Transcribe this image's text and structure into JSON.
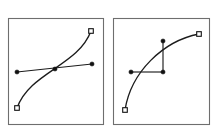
{
  "figure": {
    "width": 220,
    "height": 132,
    "background_color": "#ffffff",
    "stroke_color": "#1c1c1c",
    "frame_color": "#6e6e6e",
    "node_fill_color": "#111111",
    "node_open_fill_color": "#ffffff"
  },
  "panels": [
    {
      "id": "left",
      "name": "smooth-tangent-panel",
      "frame": {
        "x": 8,
        "y": 18,
        "width": 95,
        "height": 106
      },
      "curve": {
        "start": {
          "x": 17,
          "y": 108
        },
        "c1": {
          "x": 30,
          "y": 72
        },
        "c2": {
          "x": 78,
          "y": 66
        },
        "end": {
          "x": 91,
          "y": 31
        }
      },
      "handle_segments": [
        {
          "from": {
            "x": 17,
            "y": 72
          },
          "to": {
            "x": 92,
            "y": 64
          }
        }
      ],
      "nodes": [
        {
          "name": "curve-start-anchor",
          "type": "open-square",
          "x": 17,
          "y": 108
        },
        {
          "name": "curve-end-anchor",
          "type": "open-square",
          "x": 91,
          "y": 31
        },
        {
          "name": "handle-left-control",
          "type": "filled-dot",
          "x": 17,
          "y": 72
        },
        {
          "name": "junction-anchor",
          "type": "filled-dot",
          "x": 55,
          "y": 69
        },
        {
          "name": "handle-right-control",
          "type": "filled-dot",
          "x": 92,
          "y": 64
        }
      ]
    },
    {
      "id": "right",
      "name": "corner-tangent-panel",
      "frame": {
        "x": 113,
        "y": 18,
        "width": 96,
        "height": 106
      },
      "curve": {
        "start": {
          "x": 125,
          "y": 110
        },
        "c1": {
          "x": 131,
          "y": 72
        },
        "c2": {
          "x": 163,
          "y": 41
        },
        "end": {
          "x": 199,
          "y": 34
        }
      },
      "handle_segments": [
        {
          "from": {
            "x": 131,
            "y": 72
          },
          "to": {
            "x": 163,
            "y": 72
          }
        },
        {
          "from": {
            "x": 163,
            "y": 72
          },
          "to": {
            "x": 163,
            "y": 41
          }
        }
      ],
      "nodes": [
        {
          "name": "curve-start-anchor",
          "type": "open-square",
          "x": 125,
          "y": 110
        },
        {
          "name": "curve-end-anchor",
          "type": "open-square",
          "x": 199,
          "y": 34
        },
        {
          "name": "handle-horizontal-control",
          "type": "filled-dot",
          "x": 131,
          "y": 72
        },
        {
          "name": "junction-anchor",
          "type": "filled-dot",
          "x": 163,
          "y": 72
        },
        {
          "name": "handle-vertical-control",
          "type": "filled-dot",
          "x": 163,
          "y": 41
        }
      ]
    }
  ],
  "geometry": {
    "open_square_size": 4.6,
    "filled_dot_radius": 2.1
  }
}
